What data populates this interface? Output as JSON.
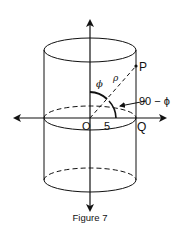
{
  "figure": {
    "caption": "Figure 7",
    "shape": "cylinder",
    "labels": {
      "point_p": "P",
      "origin": "O",
      "point_q": "Q",
      "radius_value": "5",
      "phi": "ϕ",
      "rho": "ρ",
      "complement_angle": "90 − ϕ"
    },
    "colors": {
      "stroke": "#111111",
      "background": "#ffffff"
    }
  }
}
